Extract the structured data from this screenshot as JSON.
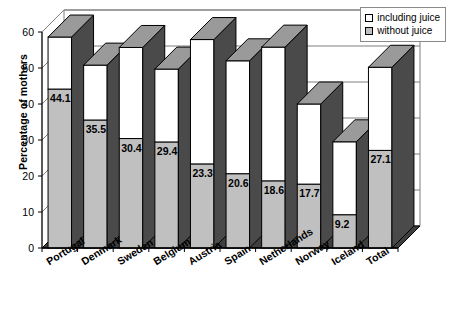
{
  "chart_data": {
    "type": "bar",
    "title": "",
    "subtitle": "",
    "xlabel": "",
    "ylabel": "Percentage of mothers",
    "ylim": [
      0,
      60
    ],
    "yticks": [
      0,
      10,
      20,
      30,
      40,
      50,
      60
    ],
    "grid": true,
    "stacked": true,
    "three_d": true,
    "legend_position": "top-right",
    "categories": [
      "Portugal",
      "Denmark",
      "Sweden",
      "Belgium",
      "Austria",
      "Spain",
      "Netherlands",
      "Norway",
      "Iceland",
      "Total"
    ],
    "series": [
      {
        "name": "including juice",
        "color": "#ffffff",
        "values": [
          58.6,
          50.8,
          55.7,
          49.7,
          57.9,
          52.0,
          55.8,
          40.0,
          29.5,
          50.2
        ]
      },
      {
        "name": "without juice",
        "color": "#c0c0c0",
        "values": [
          44.1,
          35.5,
          30.4,
          29.4,
          23.3,
          20.6,
          18.6,
          17.7,
          9.2,
          27.1
        ]
      }
    ],
    "data_labels": [
      "44.1",
      "35.5",
      "30.4",
      "29.4",
      "23.3",
      "20.6",
      "18.6",
      "17.7",
      "9.2",
      "27.1"
    ],
    "colors": {
      "bar_front_gray": "#c0c0c0",
      "bar_front_white": "#ffffff",
      "bar_side_dark": "#4a4a4a",
      "bar_top_gray": "#9a9a9a",
      "floor_dark": "#3f3f3f",
      "axis": "#000000",
      "gridline": "#7f7f7f"
    }
  },
  "legend": {
    "items": [
      {
        "label": "including juice",
        "swatch": "white"
      },
      {
        "label": "without juice",
        "swatch": "gray"
      }
    ]
  },
  "axis": {
    "y_title": "Percentage of mothers",
    "y_ticks": [
      "60",
      "50",
      "40",
      "30",
      "20",
      "10",
      "0"
    ]
  }
}
